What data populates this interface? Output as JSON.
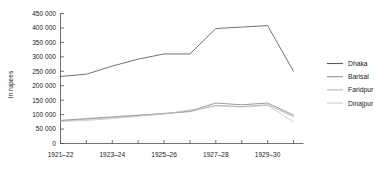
{
  "chart_data": {
    "type": "line",
    "title": "",
    "xlabel": "",
    "ylabel": "In rupees",
    "ylim": [
      0,
      450000
    ],
    "ytick_values": [
      0,
      50000,
      100000,
      150000,
      200000,
      250000,
      300000,
      350000,
      400000,
      450000
    ],
    "ytick_labels": [
      "0",
      "50 000",
      "100 000",
      "150 000",
      "200 000",
      "250 000",
      "300 000",
      "350 000",
      "400 000",
      "450 000"
    ],
    "x": [
      "1921-22",
      "1922-23",
      "1923-24",
      "1924-25",
      "1925-26",
      "1926-27",
      "1927-28",
      "1928-29",
      "1929-30",
      "1930-31"
    ],
    "xtick_labels": [
      "1921–22",
      "",
      "1923–24",
      "",
      "1925–26",
      "",
      "1927–28",
      "",
      "1929–30",
      ""
    ],
    "xtick_labels_shown": [
      "1921–22",
      "1923–24",
      "1925–26",
      "1927–28",
      "1929–30"
    ],
    "grid": false,
    "legend_position": "right",
    "series": [
      {
        "name": "Dhaka",
        "color": "#595959",
        "values": [
          232000,
          240000,
          268000,
          292000,
          310000,
          310000,
          398000,
          403000,
          408000,
          250000
        ]
      },
      {
        "name": "Barisal",
        "color": "#808080",
        "values": [
          80000,
          86000,
          92000,
          98000,
          104000,
          112000,
          140000,
          134000,
          140000,
          98000
        ]
      },
      {
        "name": "Faridpur",
        "color": "#a6a6a6",
        "values": [
          78000,
          84000,
          90000,
          97000,
          103000,
          110000,
          132000,
          128000,
          134000,
          93000
        ]
      },
      {
        "name": "Dinajpur",
        "color": "#c4c4c4",
        "values": [
          76000,
          80000,
          86000,
          94000,
          102000,
          116000,
          130000,
          126000,
          132000,
          75000
        ]
      }
    ]
  },
  "legend": {
    "entries": [
      {
        "label": "Dhaka"
      },
      {
        "label": "Barisal"
      },
      {
        "label": "Faridpur"
      },
      {
        "label": "Dinajpur"
      }
    ]
  },
  "axis": {
    "y_axis_title": "In rupees"
  }
}
